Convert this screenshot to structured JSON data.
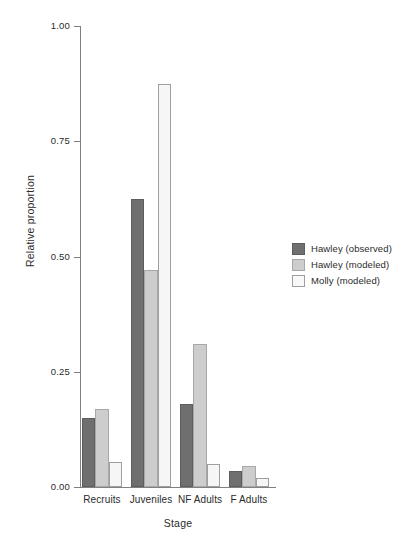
{
  "chart_data": {
    "type": "bar",
    "title": "",
    "subtitle": "",
    "xlabel": "Stage",
    "ylabel": "Relative proportion",
    "categories": [
      "Recruits",
      "Juveniles",
      "NF Adults",
      "F Adults"
    ],
    "series": [
      {
        "name": "Hawley (observed)",
        "color": "#6f6f6f",
        "values": [
          0.15,
          0.625,
          0.18,
          0.035
        ]
      },
      {
        "name": "Hawley (modeled)",
        "color": "#cdcdcd",
        "values": [
          0.17,
          0.47,
          0.31,
          0.045
        ]
      },
      {
        "name": "Molly (modeled)",
        "color": "#f8f8f8",
        "values": [
          0.055,
          0.875,
          0.05,
          0.02
        ]
      }
    ],
    "ylim": [
      0.0,
      1.0
    ],
    "yticks": [
      0.0,
      0.25,
      0.5,
      0.75,
      1.0
    ],
    "ytick_labels": [
      "0.00",
      "0.25",
      "0.50",
      "0.75",
      "1.00"
    ],
    "grid": false,
    "legend_position": "right",
    "axis_color": "#808080"
  },
  "legend": {
    "entries": [
      {
        "label": "Hawley (observed)"
      },
      {
        "label": "Hawley (modeled)"
      },
      {
        "label": "Molly (modeled)"
      }
    ]
  }
}
